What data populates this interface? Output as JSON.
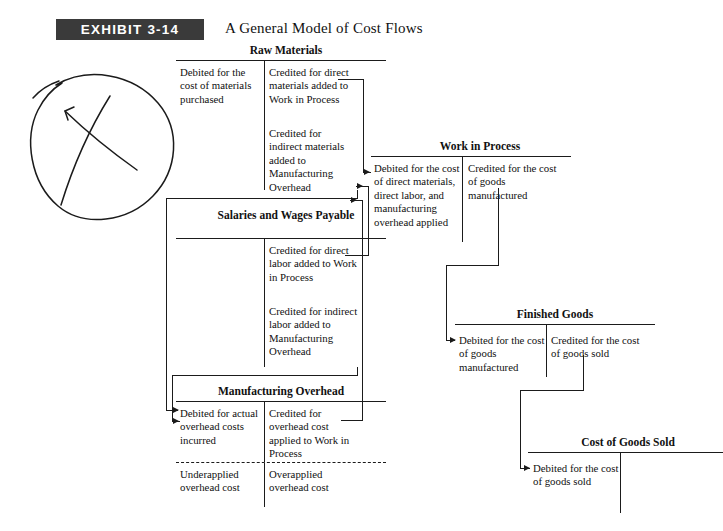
{
  "exhibit": {
    "badge": "EXHIBIT 3-14",
    "title": "A General Model of Cost Flows"
  },
  "accounts": [
    {
      "id": "raw-materials",
      "title": "Raw Materials",
      "debit": [
        "Debited for the cost of materials purchased"
      ],
      "credit": [
        "Credited for direct materials added to Work in Process",
        "Credited for indirect materials added to Manufacturing Overhead"
      ]
    },
    {
      "id": "work-in-process",
      "title": "Work in Process",
      "debit": [
        "Debited for the cost of direct materials, direct labor, and manufacturing overhead applied"
      ],
      "credit": [
        "Credited for the cost of goods manufactured"
      ]
    },
    {
      "id": "salaries-and-wages-payable",
      "title": "Salaries and Wages Payable",
      "debit": [],
      "credit": [
        "Credited for direct labor added to Work in Process",
        "Credited for indirect labor added to Manufacturing Overhead"
      ]
    },
    {
      "id": "manufacturing-overhead",
      "title": "Manufacturing Overhead",
      "debit": [
        "Debited for actual overhead costs incurred"
      ],
      "credit": [
        "Credited for overhead cost applied to Work in Process"
      ],
      "below_debit": "Underapplied overhead cost",
      "below_credit": "Overapplied overhead cost"
    },
    {
      "id": "finished-goods",
      "title": "Finished Goods",
      "debit": [
        "Debited for the cost of goods manufactured"
      ],
      "credit": [
        "Credited for the cost of goods sold"
      ]
    },
    {
      "id": "cost-of-goods-sold",
      "title": "Cost of Goods Sold",
      "debit": [
        "Debited for the cost of goods sold"
      ],
      "credit": []
    }
  ],
  "annotation": {
    "name": "hand-drawn-ellipse-with-x",
    "description": "Handwritten oval with a crossed-out X mark"
  },
  "colors": {
    "banner_background": "#3a3a3a",
    "banner_text": "#ffffff",
    "line": "#1b1b1b",
    "page_background": "#ffffff"
  }
}
